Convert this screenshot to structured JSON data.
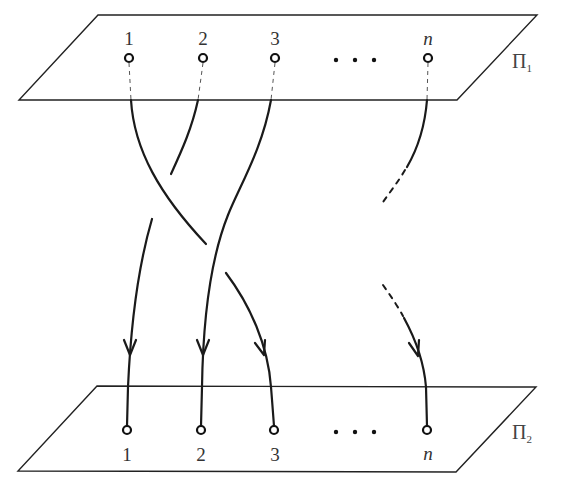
{
  "diagram": {
    "type": "braid",
    "top_plane": {
      "label_main": "Π",
      "label_sub": "1",
      "points": [
        "1",
        "2",
        "3",
        "n"
      ],
      "ellipsis": "• • •"
    },
    "bottom_plane": {
      "label_main": "Π",
      "label_sub": "2",
      "points": [
        "1",
        "2",
        "3",
        "n"
      ],
      "ellipsis": "• • •"
    },
    "strands": [
      {
        "from": "1",
        "to": "3",
        "crossings": "over strand 2, under strand 3"
      },
      {
        "from": "2",
        "to": "1",
        "crossings": "under strand 1"
      },
      {
        "from": "3",
        "to": "2",
        "crossings": "over strand 1"
      },
      {
        "from": "n",
        "to": "n",
        "style": "partially dashed"
      }
    ],
    "colors": {
      "stroke": "#1a1a1a",
      "background": "#ffffff"
    }
  }
}
